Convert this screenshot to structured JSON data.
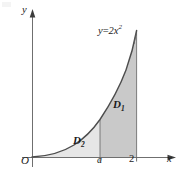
{
  "figure": {
    "background_color": "#ffffff",
    "ink_color": "#3a3a3a"
  },
  "axes": {
    "x_axis_label": "x",
    "y_axis_label": "y",
    "origin_label": "O",
    "x_ticks": [
      {
        "name": "tick-a",
        "label": "a",
        "value": "a"
      },
      {
        "name": "tick-2",
        "label": "2",
        "value": "2"
      }
    ],
    "arrow_x_name": "x-axis-arrow",
    "arrow_y_name": "y-axis-arrow"
  },
  "curve": {
    "equation_prefix": "y",
    "equation_operator": "=",
    "equation_coefficient": "2x",
    "equation_exponent": "2",
    "equation_full": "y=2x²",
    "color": "#4a4a4a"
  },
  "regions": [
    {
      "name": "region-d1",
      "label": "D",
      "subscript": "1",
      "full_label": "D1",
      "fill_color": "#c8c8c8",
      "description": "region between x=a and x=2 under the curve"
    },
    {
      "name": "region-d2",
      "label": "D",
      "subscript": "2",
      "full_label": "D2",
      "fill_color": "#e4e4e4",
      "description": "region between x=0 and x=a under the curve"
    }
  ]
}
